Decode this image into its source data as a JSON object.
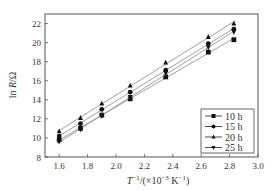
{
  "chart_data": {
    "type": "line",
    "title": "",
    "xlabel": "T^-1/(×10^-3 K^-1)",
    "xlabel_parts": {
      "main": "T",
      "sup1": "−1",
      "mid": "/(×10",
      "sup2": "−3",
      "unit": " K",
      "sup3": "−1",
      "end": ")"
    },
    "ylabel": "ln R/Ω",
    "xlim": [
      1.5,
      3.0
    ],
    "ylim": [
      8,
      23
    ],
    "xticks": [
      1.6,
      1.8,
      2.0,
      2.2,
      2.4,
      2.6,
      2.8,
      3.0
    ],
    "xtick_labels": [
      "1.6",
      "1.8",
      "2.0",
      "2.2",
      "2.4",
      "2.6",
      "2.8",
      "3.0"
    ],
    "yticks": [
      8,
      10,
      12,
      14,
      16,
      18,
      20,
      22
    ],
    "ytick_labels": [
      "8",
      "10",
      "12",
      "14",
      "16",
      "18",
      "20",
      "22"
    ],
    "grid": false,
    "legend_position": "lower right",
    "x": [
      1.6,
      1.75,
      1.9,
      2.1,
      2.35,
      2.65,
      2.83
    ],
    "series": [
      {
        "name": "10 h",
        "marker": "square",
        "values": [
          9.8,
          11.0,
          12.4,
          14.1,
          16.4,
          19.0,
          20.3
        ]
      },
      {
        "name": "15 h",
        "marker": "circle",
        "values": [
          10.2,
          11.5,
          13.0,
          14.8,
          17.1,
          19.9,
          21.4
        ]
      },
      {
        "name": "20 h",
        "marker": "triangle-up",
        "values": [
          10.7,
          12.1,
          13.6,
          15.5,
          17.9,
          20.6,
          22.0
        ]
      },
      {
        "name": "25 h",
        "marker": "triangle-down",
        "values": [
          9.6,
          10.9,
          12.3,
          14.3,
          16.8,
          19.5,
          21.1
        ]
      }
    ]
  },
  "colors": {
    "axis": "#555555",
    "line": "#888888",
    "marker": "#111111",
    "text": "#333333"
  }
}
